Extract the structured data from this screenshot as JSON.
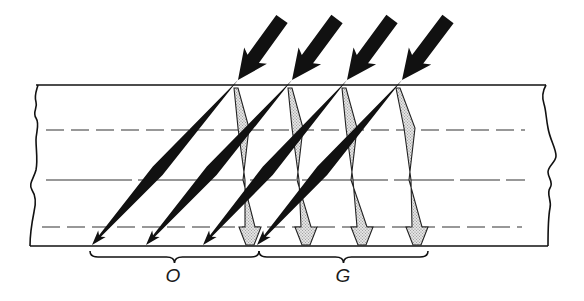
{
  "figure": {
    "labels": {
      "left_group": "O",
      "right_group": "G"
    },
    "colors": {
      "ink": "#111111",
      "stipple_fill": "#d8d8d8",
      "stipple_dot": "#777777",
      "background": "#ffffff"
    },
    "slab": {
      "top_y": 85,
      "bottom_y": 246,
      "left_x": 36,
      "right_x": 546,
      "lines": [
        {
          "y": 130,
          "style": "dashed",
          "x1": 46,
          "x2": 525
        },
        {
          "y": 180,
          "style": "solid-broken",
          "x1": 46,
          "x2": 525
        },
        {
          "y": 227,
          "style": "dashed",
          "x1": 42,
          "x2": 522
        }
      ]
    },
    "incident_rays": [
      {
        "start": [
          282,
          19
        ],
        "hit": [
          238,
          80
        ],
        "end": [
          92,
          245
        ]
      },
      {
        "start": [
          337,
          19
        ],
        "hit": [
          292,
          80
        ],
        "end": [
          146,
          245
        ]
      },
      {
        "start": [
          392,
          19
        ],
        "hit": [
          347,
          80
        ],
        "end": [
          203,
          245
        ]
      },
      {
        "start": [
          448,
          19
        ],
        "hit": [
          402,
          80
        ],
        "end": [
          257,
          245
        ]
      }
    ],
    "reflected_rays": [
      {
        "top": [
          236,
          88
        ],
        "mid": [
          244,
          148
        ],
        "bottom": [
          250,
          245
        ]
      },
      {
        "top": [
          290,
          88
        ],
        "mid": [
          298,
          148
        ],
        "bottom": [
          306,
          245
        ]
      },
      {
        "top": [
          344,
          88
        ],
        "mid": [
          352,
          148
        ],
        "bottom": [
          362,
          245
        ]
      },
      {
        "top": [
          398,
          88
        ],
        "mid": [
          410,
          148
        ],
        "bottom": [
          417,
          245
        ]
      }
    ],
    "braces": [
      {
        "x1": 90,
        "x2": 259,
        "y": 255,
        "label_key": "left_group",
        "label_x": 173,
        "label_y": 266
      },
      {
        "x1": 259,
        "x2": 428,
        "y": 255,
        "label_key": "right_group",
        "label_x": 343,
        "label_y": 266
      }
    ]
  }
}
